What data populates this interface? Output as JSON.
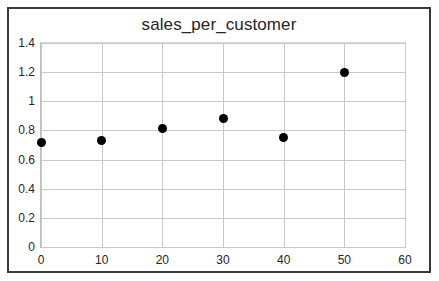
{
  "chart_data": {
    "type": "scatter",
    "title": "sales_per_customer",
    "xlabel": "",
    "ylabel": "",
    "x": [
      0,
      10,
      20,
      30,
      40,
      50
    ],
    "values": [
      0.72,
      0.73,
      0.81,
      0.88,
      0.75,
      1.2
    ],
    "points": [
      {
        "x": 0,
        "y": 0.72
      },
      {
        "x": 10,
        "y": 0.73
      },
      {
        "x": 20,
        "y": 0.81
      },
      {
        "x": 30,
        "y": 0.88
      },
      {
        "x": 40,
        "y": 0.75
      },
      {
        "x": 50,
        "y": 1.2
      }
    ],
    "xlim": [
      0,
      60
    ],
    "ylim": [
      0,
      1.4
    ],
    "xticks": [
      "0",
      "10",
      "20",
      "30",
      "40",
      "50",
      "60"
    ],
    "xtick_values": [
      0,
      10,
      20,
      30,
      40,
      50,
      60
    ],
    "yticks": [
      "0",
      "0.2",
      "0.4",
      "0.6",
      "0.8",
      "1",
      "1.2",
      "1.4"
    ],
    "ytick_values": [
      0,
      0.2,
      0.4,
      0.6,
      0.8,
      1,
      1.2,
      1.4
    ],
    "grid": true,
    "legend": null,
    "marker_color": "#000000",
    "grid_color": "#c9c9c9",
    "frame_color": "#3a3a3a",
    "background": "#ffffff"
  }
}
